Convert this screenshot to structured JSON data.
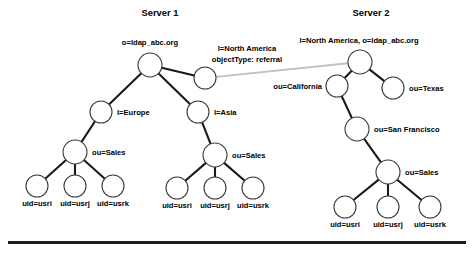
{
  "figure": {
    "type": "diagram",
    "background_color": "#ffffff",
    "edge_color": "#1a1a1a",
    "referral_edge_color": "#c2c2c2",
    "node_fill": "#ffffff",
    "node_stroke": "#3a3a3a",
    "text_color": "#000000"
  },
  "servers": {
    "server1": {
      "title": "Server 1",
      "title_x": 160,
      "title_y": 16
    },
    "server2": {
      "title": "Server 2",
      "title_x": 371,
      "title_y": 16
    }
  },
  "nodes": [
    {
      "id": "s1-root",
      "x": 150,
      "y": 65,
      "r": 12
    },
    {
      "id": "s1-referral",
      "x": 205,
      "y": 78,
      "r": 11
    },
    {
      "id": "s1-europe",
      "x": 101,
      "y": 112,
      "r": 11
    },
    {
      "id": "s1-asia",
      "x": 198,
      "y": 112,
      "r": 11
    },
    {
      "id": "s1-eu-sales",
      "x": 75,
      "y": 152,
      "r": 12
    },
    {
      "id": "s1-as-sales",
      "x": 215,
      "y": 155,
      "r": 12
    },
    {
      "id": "s1-eu-usri",
      "x": 37,
      "y": 186,
      "r": 11
    },
    {
      "id": "s1-eu-usrj",
      "x": 75,
      "y": 186,
      "r": 11
    },
    {
      "id": "s1-eu-usrk",
      "x": 113,
      "y": 186,
      "r": 11
    },
    {
      "id": "s1-as-usri",
      "x": 177,
      "y": 188,
      "r": 11
    },
    {
      "id": "s1-as-usrj",
      "x": 215,
      "y": 188,
      "r": 11
    },
    {
      "id": "s1-as-usrk",
      "x": 253,
      "y": 188,
      "r": 11
    },
    {
      "id": "s2-root",
      "x": 360,
      "y": 62,
      "r": 12
    },
    {
      "id": "s2-california",
      "x": 337,
      "y": 86,
      "r": 11
    },
    {
      "id": "s2-texas",
      "x": 393,
      "y": 88,
      "r": 11
    },
    {
      "id": "s2-sanfran",
      "x": 357,
      "y": 129,
      "r": 12
    },
    {
      "id": "s2-sales",
      "x": 388,
      "y": 172,
      "r": 12
    },
    {
      "id": "s2-usri",
      "x": 345,
      "y": 207,
      "r": 11
    },
    {
      "id": "s2-usrj",
      "x": 388,
      "y": 207,
      "r": 11
    },
    {
      "id": "s2-usrk",
      "x": 430,
      "y": 207,
      "r": 11
    }
  ],
  "edges": [
    {
      "from": "s1-root",
      "to": "s1-europe"
    },
    {
      "from": "s1-root",
      "to": "s1-asia"
    },
    {
      "from": "s1-root",
      "to": "s1-referral"
    },
    {
      "from": "s1-europe",
      "to": "s1-eu-sales"
    },
    {
      "from": "s1-asia",
      "to": "s1-as-sales"
    },
    {
      "from": "s1-eu-sales",
      "to": "s1-eu-usri"
    },
    {
      "from": "s1-eu-sales",
      "to": "s1-eu-usrj"
    },
    {
      "from": "s1-eu-sales",
      "to": "s1-eu-usrk"
    },
    {
      "from": "s1-as-sales",
      "to": "s1-as-usri"
    },
    {
      "from": "s1-as-sales",
      "to": "s1-as-usrj"
    },
    {
      "from": "s1-as-sales",
      "to": "s1-as-usrk"
    },
    {
      "from": "s2-root",
      "to": "s2-california"
    },
    {
      "from": "s2-root",
      "to": "s2-texas"
    },
    {
      "from": "s2-california",
      "to": "s2-sanfran"
    },
    {
      "from": "s2-sanfran",
      "to": "s2-sales"
    },
    {
      "from": "s2-sales",
      "to": "s2-usri"
    },
    {
      "from": "s2-sales",
      "to": "s2-usrj"
    },
    {
      "from": "s2-sales",
      "to": "s2-usrk"
    }
  ],
  "referral_edge": {
    "from": "s1-referral",
    "to": "s2-root"
  },
  "labels": [
    {
      "id": "lbl-s1-root",
      "text": "o=ldap_abc.org",
      "x": 150,
      "y": 45,
      "anchor": "middle"
    },
    {
      "id": "lbl-s1-ref-1",
      "text": "l=North America",
      "x": 247,
      "y": 51,
      "anchor": "middle"
    },
    {
      "id": "lbl-s1-ref-2",
      "text": "objectType: referral",
      "x": 247,
      "y": 62,
      "anchor": "middle"
    },
    {
      "id": "lbl-s1-europe",
      "text": "l=Europe",
      "x": 117,
      "y": 115,
      "anchor": "start"
    },
    {
      "id": "lbl-s1-asia",
      "text": "l=Asia",
      "x": 214,
      "y": 115,
      "anchor": "start"
    },
    {
      "id": "lbl-s1-eu-sales",
      "text": "ou=Sales",
      "x": 92,
      "y": 155,
      "anchor": "start"
    },
    {
      "id": "lbl-s1-as-sales",
      "text": "ou=Sales",
      "x": 232,
      "y": 158,
      "anchor": "start"
    },
    {
      "id": "lbl-s1-eu-usri",
      "text": "uid=usri",
      "x": 37,
      "y": 206,
      "anchor": "middle"
    },
    {
      "id": "lbl-s1-eu-usrj",
      "text": "uid=usrj",
      "x": 75,
      "y": 206,
      "anchor": "middle"
    },
    {
      "id": "lbl-s1-eu-usrk",
      "text": "uid=usrk",
      "x": 113,
      "y": 206,
      "anchor": "middle"
    },
    {
      "id": "lbl-s1-as-usri",
      "text": "uid=usri",
      "x": 177,
      "y": 208,
      "anchor": "middle"
    },
    {
      "id": "lbl-s1-as-usrj",
      "text": "uid=usrj",
      "x": 215,
      "y": 208,
      "anchor": "middle"
    },
    {
      "id": "lbl-s1-as-usrk",
      "text": "uid=usrk",
      "x": 253,
      "y": 208,
      "anchor": "middle"
    },
    {
      "id": "lbl-s2-root",
      "text": "l=North America, o=ldap_abc.org",
      "x": 359,
      "y": 43,
      "anchor": "middle"
    },
    {
      "id": "lbl-s2-california",
      "text": "ou=California",
      "x": 322,
      "y": 89,
      "anchor": "end"
    },
    {
      "id": "lbl-s2-texas",
      "text": "ou=Texas",
      "x": 409,
      "y": 91,
      "anchor": "start"
    },
    {
      "id": "lbl-s2-sanfran",
      "text": "ou=San Francisco",
      "x": 374,
      "y": 132,
      "anchor": "start"
    },
    {
      "id": "lbl-s2-sales",
      "text": "ou=Sales",
      "x": 405,
      "y": 175,
      "anchor": "start"
    },
    {
      "id": "lbl-s2-usri",
      "text": "uid=usri",
      "x": 345,
      "y": 227,
      "anchor": "middle"
    },
    {
      "id": "lbl-s2-usrj",
      "text": "uid=usrj",
      "x": 388,
      "y": 227,
      "anchor": "middle"
    },
    {
      "id": "lbl-s2-usrk",
      "text": "uid=usrk",
      "x": 430,
      "y": 227,
      "anchor": "middle"
    }
  ],
  "rule": {
    "x": 8,
    "y": 241,
    "width": 458,
    "height": 3
  }
}
